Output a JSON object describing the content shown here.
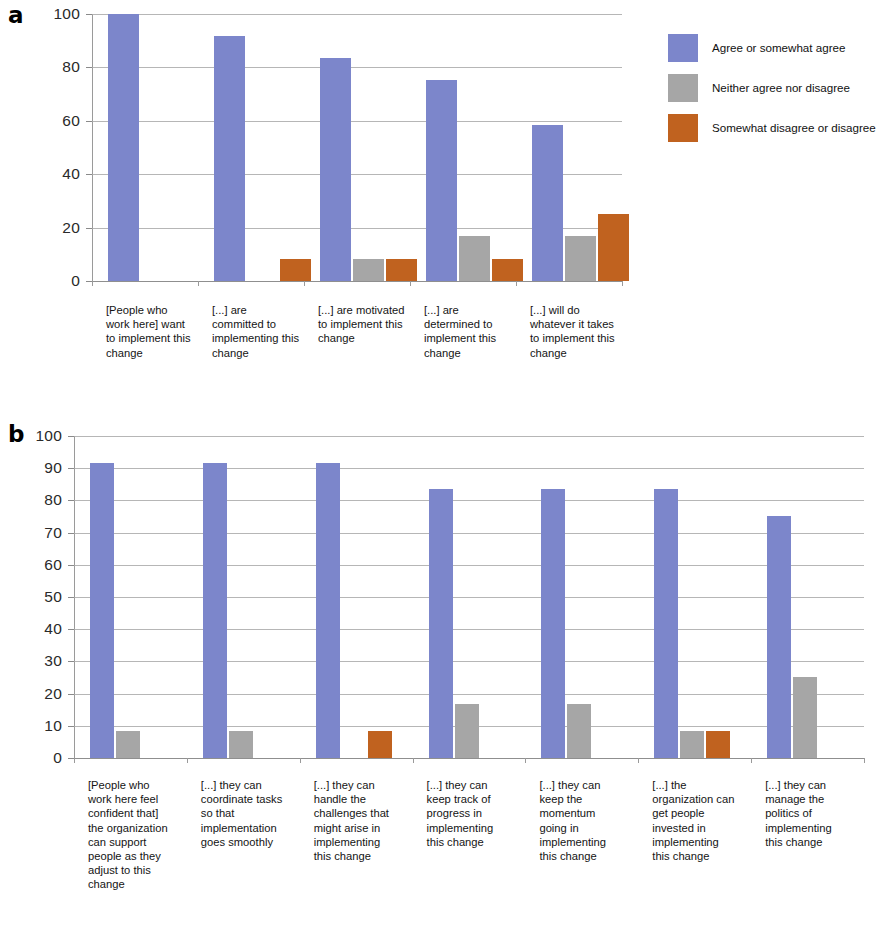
{
  "figure": {
    "panel_a_letter": "a",
    "panel_b_letter": "b"
  },
  "legend": {
    "position": "right-top",
    "items": [
      {
        "label": "Agree or somewhat agree",
        "color": "#7C86CB"
      },
      {
        "label": "Neither agree nor disagree",
        "color": "#A6A6A6"
      },
      {
        "label": "Somewhat disagree or disagree",
        "color": "#C0621F"
      }
    ]
  },
  "colors": {
    "agree": "#7C86CB",
    "neither": "#A6A6A6",
    "disagree": "#C0621F",
    "gridline": "#a9a9a9",
    "axis": "#8f8f8f",
    "text": "#141414"
  },
  "chart_data": [
    {
      "type": "bar",
      "id": "panel-a",
      "title": "",
      "xlabel": "",
      "ylabel": "",
      "ylim": [
        0,
        100
      ],
      "yticks": [
        0,
        20,
        40,
        60,
        80,
        100
      ],
      "ytick_labels": [
        "0",
        "20",
        "40",
        "60",
        "80",
        "100"
      ],
      "grid": true,
      "legend": [
        "Agree or somewhat agree",
        "Neither agree nor disagree",
        "Somewhat disagree or disagree"
      ],
      "categories": [
        "[People who work here] want to implement this change",
        "[...] are committed to implementing this change",
        "[...] are motivated to implement this change",
        "[...] are determined to implement this change",
        "[...] will do whatever it takes to implement this change"
      ],
      "series": [
        {
          "name": "Agree or somewhat agree",
          "color": "#7C86CB",
          "values": [
            100,
            91.7,
            83.4,
            75.1,
            58.4
          ]
        },
        {
          "name": "Neither agree nor disagree",
          "color": "#A6A6A6",
          "values": [
            0,
            0,
            8.3,
            16.7,
            16.7
          ]
        },
        {
          "name": "Somewhat disagree or disagree",
          "color": "#C0621F",
          "values": [
            0,
            8.3,
            8.3,
            8.3,
            25.1
          ]
        }
      ]
    },
    {
      "type": "bar",
      "id": "panel-b",
      "title": "",
      "xlabel": "",
      "ylabel": "",
      "ylim": [
        0,
        100
      ],
      "yticks": [
        0,
        10,
        20,
        30,
        40,
        50,
        60,
        70,
        80,
        90,
        100
      ],
      "ytick_labels": [
        "0",
        "10",
        "20",
        "30",
        "40",
        "50",
        "60",
        "70",
        "80",
        "90",
        "100"
      ],
      "grid": true,
      "legend": [
        "Agree or somewhat agree",
        "Neither agree nor disagree",
        "Somewhat disagree or disagree"
      ],
      "categories": [
        "[People who work here feel confident that] the organization can support people as they adjust to this change",
        "[...] they can coordinate tasks so that implementation goes smoothly",
        "[...] they can handle the challenges that might arise in implementing this change",
        "[...] they can keep track of progress in implementing this change",
        "[...] they can keep the momentum going in implementing this change",
        "[...] the organization can get people invested in implementing this change",
        "[...] they can manage the politics of implementing this change"
      ],
      "series": [
        {
          "name": "Agree or somewhat agree",
          "color": "#7C86CB",
          "values": [
            91.7,
            91.7,
            91.7,
            83.4,
            83.4,
            83.4,
            75.1
          ]
        },
        {
          "name": "Neither agree nor disagree",
          "color": "#A6A6A6",
          "values": [
            8.3,
            8.3,
            0,
            16.7,
            16.7,
            8.3,
            25.1
          ]
        },
        {
          "name": "Somewhat disagree or disagree",
          "color": "#C0621F",
          "values": [
            0,
            0,
            8.3,
            0,
            0,
            8.3,
            0
          ]
        }
      ]
    }
  ]
}
